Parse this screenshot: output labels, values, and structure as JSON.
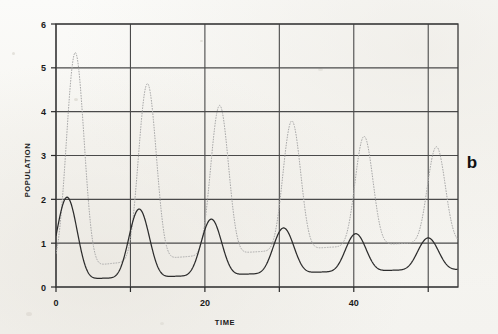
{
  "figure": {
    "panel_label": "b",
    "background_note": "scanned-page"
  },
  "chart_data": {
    "type": "line",
    "title": "",
    "subtitle": "",
    "xlabel": "TIME",
    "ylabel": "POPULATION",
    "xlim": [
      0,
      54
    ],
    "ylim": [
      0,
      6
    ],
    "xticks": [
      0,
      20,
      40
    ],
    "xtick_labels": [
      "0",
      "20",
      "40"
    ],
    "yticks": [
      0,
      1,
      2,
      3,
      4,
      5,
      6
    ],
    "ytick_labels": [
      "0",
      "1",
      "2",
      "3",
      "4",
      "5",
      "6"
    ],
    "gridlines_x": [
      0,
      10,
      20,
      30,
      40,
      50
    ],
    "gridlines_y": [
      0,
      1,
      2,
      3,
      4,
      5,
      6
    ],
    "grid": true,
    "legend": "none",
    "series": [
      {
        "name": "predator",
        "color": "#a8a8a8",
        "style": "dotted-thin",
        "peak_times": [
          2.6,
          12.1,
          21.8,
          31.4,
          40.9,
          50.3
        ],
        "peak_values": [
          5.35,
          4.65,
          4.15,
          3.8,
          3.45,
          3.2
        ],
        "trough_values": [
          0.45,
          0.62,
          0.75,
          0.85,
          0.95,
          1.02
        ],
        "period": 9.7,
        "start_value": 0.55
      },
      {
        "name": "prey",
        "color": "#2c2c2c",
        "style": "solid",
        "peak_times": [
          1.5,
          11.1,
          20.8,
          30.4,
          39.9,
          49.4
        ],
        "peak_values": [
          2.05,
          1.78,
          1.55,
          1.35,
          1.22,
          1.12
        ],
        "trough_values": [
          0.18,
          0.22,
          0.27,
          0.32,
          0.36,
          0.4
        ],
        "period": 9.7,
        "start_value": 1.0
      }
    ]
  }
}
